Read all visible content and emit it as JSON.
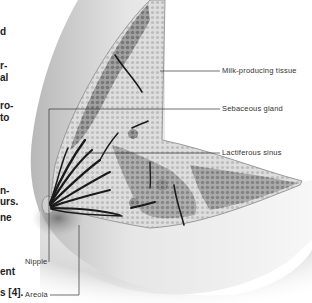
{
  "figure": {
    "labels": {
      "milk_producing_tissue": "Milk-producing tissue",
      "sebaceous_gland": "Sebaceous gland",
      "lactiferous_sinus": "Lactiferous sinus",
      "nipple": "Nipple",
      "areola": "Areola"
    }
  },
  "left_column_fragments": [
    {
      "text": "d",
      "top": 26
    },
    {
      "text": "r-",
      "top": 60
    },
    {
      "text": "al",
      "top": 72
    },
    {
      "text": "ro-",
      "top": 100
    },
    {
      "text": "to",
      "top": 112
    },
    {
      "text": "n-",
      "top": 185
    },
    {
      "text": "urs.",
      "top": 196
    },
    {
      "text": "ne",
      "top": 212
    },
    {
      "text": "ent",
      "top": 266
    },
    {
      "text": "s [4].",
      "top": 287
    }
  ],
  "colors": {
    "skin_shade": "#c8c8c8",
    "tissue_dark": "#8a8a8a",
    "tissue_light": "#d6d6d6",
    "duct": "#1a1a1a",
    "leader_line": "#333333"
  }
}
